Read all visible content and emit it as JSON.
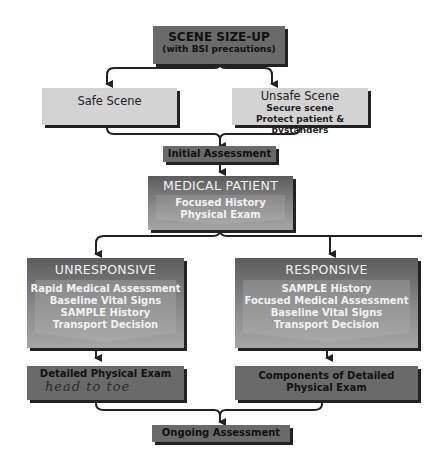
{
  "diagram": {
    "type": "flowchart",
    "nodes": {
      "scene_sizeup": {
        "title": "SCENE SIZE-UP",
        "subtitle": "(with BSI precautions)"
      },
      "safe_scene": {
        "title": "Safe Scene"
      },
      "unsafe_scene": {
        "title": "Unsafe Scene",
        "lines": [
          "Secure scene",
          "Protect patient & bystanders"
        ]
      },
      "initial_assessment": {
        "title": "Initial Assessment"
      },
      "medical_patient": {
        "title": "MEDICAL PATIENT",
        "lines": [
          "Focused History",
          "Physical Exam"
        ]
      },
      "unresponsive": {
        "title": "UNRESPONSIVE",
        "lines": [
          "Rapid Medical Assessment",
          "Baseline Vital Signs",
          "SAMPLE History",
          "Transport Decision"
        ]
      },
      "responsive": {
        "title": "RESPONSIVE",
        "lines": [
          "SAMPLE History",
          "Focused Medical Assessment",
          "Baseline Vital Signs",
          "Transport Decision"
        ]
      },
      "detailed_exam": {
        "title": "Detailed Physical Exam",
        "handwritten_note": "head to toe"
      },
      "components_exam": {
        "title": "Components of Detailed",
        "title2": "Physical Exam"
      },
      "ongoing_assessment": {
        "title": "Ongoing Assessment"
      }
    },
    "edges": [
      [
        "scene_sizeup",
        "safe_scene"
      ],
      [
        "scene_sizeup",
        "unsafe_scene"
      ],
      [
        "safe_scene",
        "initial_assessment"
      ],
      [
        "unsafe_scene",
        "initial_assessment"
      ],
      [
        "initial_assessment",
        "medical_patient"
      ],
      [
        "medical_patient",
        "unresponsive"
      ],
      [
        "medical_patient",
        "responsive"
      ],
      [
        "unresponsive",
        "detailed_exam"
      ],
      [
        "responsive",
        "components_exam"
      ],
      [
        "detailed_exam",
        "ongoing_assessment"
      ],
      [
        "components_exam",
        "ongoing_assessment"
      ]
    ],
    "colors": {
      "dark_box": "#6a6a6a",
      "light_box": "#d3d3d3",
      "connector": "#222222"
    }
  }
}
